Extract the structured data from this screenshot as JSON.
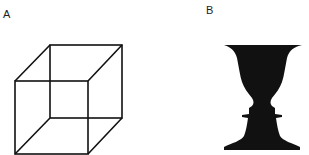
{
  "panels": [
    {
      "label": "A",
      "figure": "Necker cube (wireframe line drawing)"
    },
    {
      "label": "B",
      "figure": "Rubin vase (figure-ground silhouette of vase / two faces)"
    }
  ],
  "colors": {
    "background": "#ffffff",
    "ink": "#111111"
  }
}
